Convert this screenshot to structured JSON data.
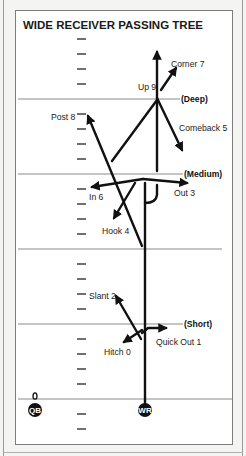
{
  "diagram": {
    "title": "WIDE RECEIVER PASSING TREE",
    "zones": [
      {
        "label": "(Deep)",
        "y": 99
      },
      {
        "label": "(Medium)",
        "y": 174
      },
      {
        "label": "(Short)",
        "y": 324
      }
    ],
    "players": {
      "qb": {
        "label": "QB",
        "marker_label": "0"
      },
      "wr": {
        "label": "WR"
      }
    },
    "routes": [
      {
        "number": 0,
        "name": "Hitch",
        "label": "Hitch 0"
      },
      {
        "number": 1,
        "name": "Quick Out",
        "label": "Quick Out 1"
      },
      {
        "number": 2,
        "name": "Slant",
        "label": "Slant 2"
      },
      {
        "number": 3,
        "name": "Out",
        "label": "Out 3"
      },
      {
        "number": 4,
        "name": "Hook",
        "label": "Hook 4"
      },
      {
        "number": 5,
        "name": "Comeback",
        "label": "Comeback 5"
      },
      {
        "number": 6,
        "name": "In",
        "label": "In 6"
      },
      {
        "number": 7,
        "name": "Corner",
        "label": "Corner 7"
      },
      {
        "number": 8,
        "name": "Post",
        "label": "Post 8"
      },
      {
        "number": 9,
        "name": "Up",
        "label": "Up 9"
      }
    ],
    "colors": {
      "ink": "#111111",
      "line": "#8a8a8a",
      "panel": "#ffffff",
      "page": "#f4f4f2"
    }
  }
}
